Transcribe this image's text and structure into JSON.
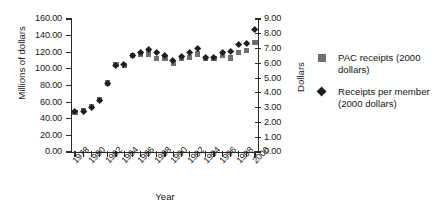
{
  "chart_data": {
    "type": "scatter",
    "title": "",
    "xlabel": "Year",
    "ylabel": "Millions of dollars",
    "ylabel_right": "Dollars",
    "xlim": [
      1977.5,
      2000.5
    ],
    "ylim": [
      0,
      160
    ],
    "ylim_right": [
      0,
      9
    ],
    "grid": false,
    "legend_position": "right",
    "x": [
      1978,
      1979,
      1980,
      1981,
      1982,
      1983,
      1984,
      1985,
      1986,
      1987,
      1988,
      1989,
      1990,
      1991,
      1992,
      1993,
      1994,
      1995,
      1996,
      1997,
      1998,
      1999,
      2000
    ],
    "xtick_labels": [
      "1978",
      "1980",
      "1982",
      "1984",
      "1986",
      "1988",
      "1990",
      "1992",
      "1994",
      "1996",
      "1998",
      "2000"
    ],
    "xtick_values": [
      1978,
      1980,
      1982,
      1984,
      1986,
      1988,
      1990,
      1992,
      1994,
      1996,
      1998,
      2000
    ],
    "ytick_labels_left": [
      "160.00",
      "140.00",
      "120.00",
      "100.00",
      "80.00",
      "60.00",
      "40.00",
      "20.00",
      "0.00"
    ],
    "ytick_values_left": [
      160,
      140,
      120,
      100,
      80,
      60,
      40,
      20,
      0
    ],
    "ytick_labels_right": [
      "9.00",
      "8.00",
      "7.00",
      "6.00",
      "5.00",
      "4.00",
      "3.00",
      "2.00",
      "1.00",
      "0.00"
    ],
    "ytick_values_right": [
      9,
      8,
      7,
      6,
      5,
      4,
      3,
      2,
      1,
      0
    ],
    "series": [
      {
        "name": "PAC receipts (2000 dollars)",
        "marker": "square",
        "color": "#6f6f6f",
        "axis": "left",
        "values": [
          48,
          50,
          55,
          63,
          83,
          105,
          104,
          116,
          118,
          118,
          112,
          113,
          107,
          113,
          114,
          118,
          112,
          112,
          116,
          113,
          120,
          122,
          132
        ]
      },
      {
        "name": "Receipts per member (2000 dollars)",
        "marker": "diamond",
        "color": "#1f1f1f",
        "axis": "right",
        "values": [
          2.7,
          2.75,
          3.0,
          3.45,
          4.6,
          5.85,
          5.9,
          6.5,
          6.7,
          6.9,
          6.75,
          6.55,
          6.15,
          6.45,
          6.7,
          7.0,
          6.4,
          6.4,
          6.75,
          6.8,
          7.25,
          7.3,
          8.3
        ]
      }
    ]
  },
  "legend": {
    "items": [
      {
        "label": "PAC receipts (2000 dollars)",
        "marker": "square"
      },
      {
        "label": "Receipts per member (2000 dollars)",
        "marker": "diamond"
      }
    ]
  }
}
